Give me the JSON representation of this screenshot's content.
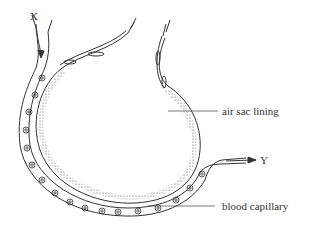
{
  "diagram": {
    "type": "biology-diagram",
    "labels": {
      "x": "X",
      "y": "Y",
      "air_sac_lining": "air sac lining",
      "blood_capillary": "blood capillary"
    },
    "colors": {
      "ink": "#333333",
      "background": "#ffffff"
    }
  }
}
